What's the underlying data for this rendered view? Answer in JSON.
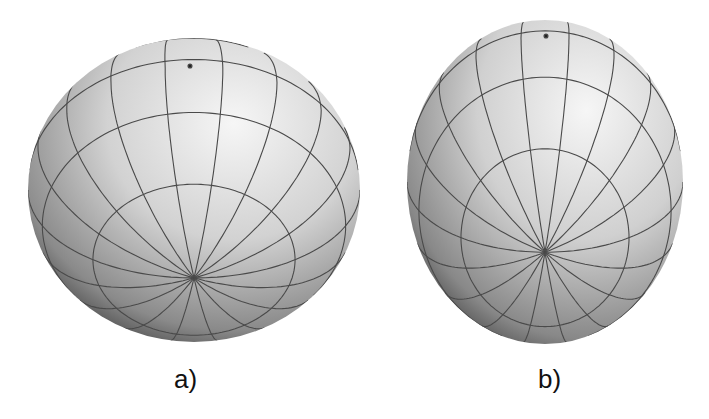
{
  "figure": {
    "background": "#ffffff",
    "grid_color": "#4a4a4a",
    "shading": {
      "highlight": "#f4f4f4",
      "mid": "#c4c4c4",
      "shadow": "#2e2e2e"
    },
    "panels": [
      {
        "id": "a",
        "label": "a)",
        "shape": "oblate spheroid",
        "cx": 194,
        "cy": 190,
        "rx": 166,
        "ry": 152,
        "pole": [
          190,
          66
        ],
        "tilt_deg": 0,
        "latitudes": 5,
        "meridians": 18
      },
      {
        "id": "b",
        "label": "b)",
        "shape": "prolate spheroid",
        "cx": 545,
        "cy": 182,
        "rx": 138,
        "ry": 162,
        "pole": [
          546,
          36
        ],
        "tilt_deg": 0,
        "latitudes": 5,
        "meridians": 18
      }
    ]
  }
}
